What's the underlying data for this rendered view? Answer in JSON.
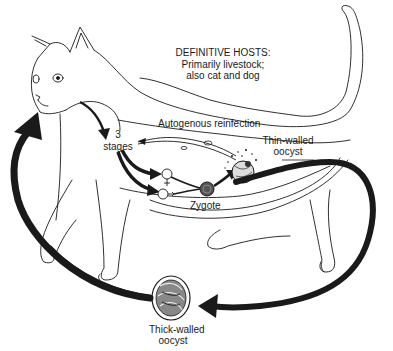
{
  "diagram": {
    "type": "parasite-life-cycle",
    "host_illustration": "cat",
    "labels": {
      "definitive_hosts_title": "DEFINITIVE HOSTS:",
      "definitive_hosts_line1": "Primarily livestock;",
      "definitive_hosts_line2": "also cat and dog",
      "autogenous_reinfection": "Autogenous reinfection",
      "stages_count": "3",
      "stages_word": "stages",
      "thin_walled_line1": "Thin-walled",
      "thin_walled_line2": "oocyst",
      "zygote": "Zygote",
      "thick_walled_line1": "Thick-walled",
      "thick_walled_line2": "oocyst"
    },
    "stages": [
      {
        "id": "ingestion",
        "icon": "arrow-down-icon"
      },
      {
        "id": "asexual-stages",
        "label": "3 stages"
      },
      {
        "id": "female-gamete",
        "icon": "female-symbol-icon"
      },
      {
        "id": "male-gamete",
        "icon": "male-symbol-icon"
      },
      {
        "id": "zygote",
        "label": "Zygote"
      },
      {
        "id": "thin-walled-oocyst",
        "label": "Thin-walled oocyst"
      },
      {
        "id": "thick-walled-oocyst",
        "label": "Thick-walled oocyst"
      }
    ],
    "colors": {
      "line": "#1a1a1a",
      "background": "#ffffff"
    }
  }
}
